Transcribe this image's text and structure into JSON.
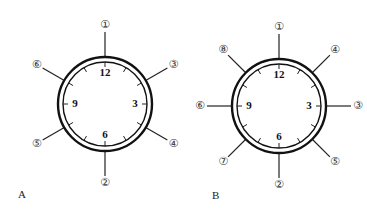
{
  "figure": {
    "panels": [
      {
        "letter": "A",
        "center": [
          105,
          104
        ],
        "hour_labels": {
          "12": "12",
          "3": "3",
          "6": "6",
          "9": "9"
        },
        "markers": [
          {
            "label": "①",
            "angle_deg": 0
          },
          {
            "label": "③",
            "angle_deg": 60
          },
          {
            "label": "④",
            "angle_deg": 120
          },
          {
            "label": "②",
            "angle_deg": 180
          },
          {
            "label": "⑤",
            "angle_deg": 240
          },
          {
            "label": "⑥",
            "angle_deg": 300
          }
        ]
      },
      {
        "letter": "B",
        "center": [
          279,
          106
        ],
        "hour_labels": {
          "12": "12",
          "3": "3",
          "6": "6",
          "9": "9"
        },
        "markers": [
          {
            "label": "①",
            "angle_deg": 0
          },
          {
            "label": "④",
            "angle_deg": 45
          },
          {
            "label": "③",
            "angle_deg": 90
          },
          {
            "label": "⑤",
            "angle_deg": 135
          },
          {
            "label": "②",
            "angle_deg": 180
          },
          {
            "label": "⑦",
            "angle_deg": 225
          },
          {
            "label": "⑥",
            "angle_deg": 270
          },
          {
            "label": "⑧",
            "angle_deg": 315
          }
        ]
      }
    ]
  }
}
